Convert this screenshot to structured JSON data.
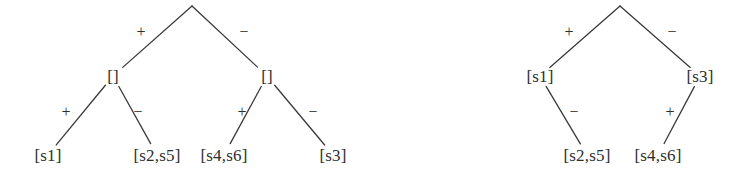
{
  "figure": {
    "kind": "two-binary-tree-diagrams",
    "background_color": "#ffffff",
    "stroke_color": "#3a3a3a",
    "text_color": "#2e2e2e"
  },
  "trees": [
    {
      "name": "left-tree",
      "nodes": [
        {
          "id": "L-root",
          "label": "",
          "x": 192,
          "y": 6
        },
        {
          "id": "L-n1",
          "label": "[]",
          "x": 113,
          "y": 76
        },
        {
          "id": "L-n2",
          "label": "[]",
          "x": 267,
          "y": 76
        },
        {
          "id": "L-leaf1",
          "label": "[s1]",
          "x": 48,
          "y": 155
        },
        {
          "id": "L-leaf2",
          "label": "[s2,s5]",
          "x": 157,
          "y": 155
        },
        {
          "id": "L-leaf3",
          "label": "[s4,s6]",
          "x": 224,
          "y": 155
        },
        {
          "id": "L-leaf4",
          "label": "[s3]",
          "x": 333,
          "y": 155
        }
      ],
      "edges": [
        {
          "from": "L-root",
          "to": "L-n1",
          "label": "+",
          "label_x": 141,
          "label_y": 32
        },
        {
          "from": "L-root",
          "to": "L-n2",
          "label": "−",
          "label_x": 244,
          "label_y": 32
        },
        {
          "from": "L-n1",
          "to": "L-leaf1",
          "label": "+",
          "label_x": 66,
          "label_y": 112
        },
        {
          "from": "L-n1",
          "to": "L-leaf2",
          "label": "−",
          "label_x": 138,
          "label_y": 112
        },
        {
          "from": "L-n2",
          "to": "L-leaf3",
          "label": "+",
          "label_x": 242,
          "label_y": 112
        },
        {
          "from": "L-n2",
          "to": "L-leaf4",
          "label": "−",
          "label_x": 313,
          "label_y": 112
        }
      ]
    },
    {
      "name": "right-tree",
      "nodes": [
        {
          "id": "R-root",
          "label": "",
          "x": 620,
          "y": 6
        },
        {
          "id": "R-n1",
          "label": "[s1]",
          "x": 540,
          "y": 76
        },
        {
          "id": "R-n2",
          "label": "[s3]",
          "x": 700,
          "y": 76
        },
        {
          "id": "R-leaf1",
          "label": "[s2,s5]",
          "x": 587,
          "y": 155
        },
        {
          "id": "R-leaf2",
          "label": "[s4,s6]",
          "x": 658,
          "y": 155
        }
      ],
      "edges": [
        {
          "from": "R-root",
          "to": "R-n1",
          "label": "+",
          "label_x": 569,
          "label_y": 32
        },
        {
          "from": "R-root",
          "to": "R-n2",
          "label": "−",
          "label_x": 672,
          "label_y": 32
        },
        {
          "from": "R-n1",
          "to": "R-leaf1",
          "label": "−",
          "label_x": 574,
          "label_y": 112
        },
        {
          "from": "R-n2",
          "to": "R-leaf2",
          "label": "+",
          "label_x": 670,
          "label_y": 112
        }
      ]
    }
  ]
}
